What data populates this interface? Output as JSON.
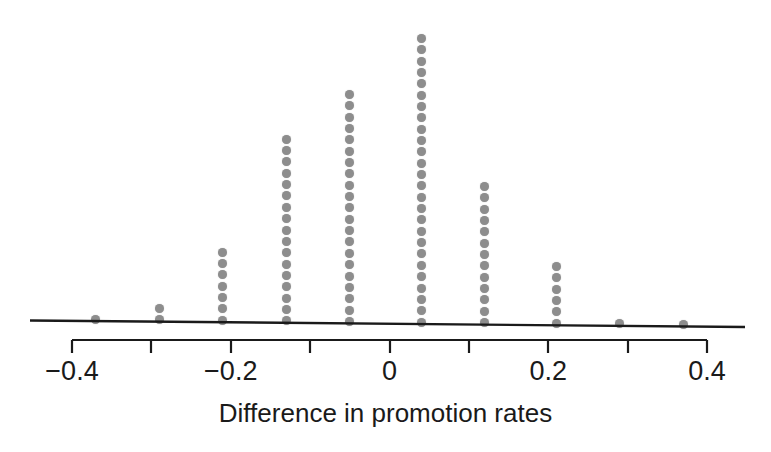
{
  "chart_data": {
    "type": "scatter",
    "plot_style": "dotplot",
    "title": "",
    "subtitle": "",
    "xlabel": "Difference in promotion rates",
    "ylabel": "",
    "xlim": [
      -0.44,
      0.44
    ],
    "xticks": [
      -0.4,
      -0.3,
      -0.2,
      -0.1,
      0,
      0.1,
      0.2,
      0.3,
      0.4
    ],
    "xticklabels": [
      "−0.4",
      "",
      "−0.2",
      "",
      "0",
      "",
      "0.2",
      "",
      "0.4"
    ],
    "labeled_ticks": [
      "−0.4",
      "−0.2",
      "0",
      "0.2",
      "0.4"
    ],
    "grid": false,
    "legend": false,
    "dot_color": "#8d8d8d",
    "axis_color": "#1a1a1a",
    "categories": [
      -0.37,
      -0.29,
      -0.21,
      -0.13,
      -0.05,
      0.04,
      0.12,
      0.21,
      0.29,
      0.37
    ],
    "values": [
      1,
      2,
      7,
      17,
      21,
      26,
      13,
      6,
      1,
      1
    ],
    "points": [
      {
        "x": -0.37,
        "count": 1
      },
      {
        "x": -0.29,
        "count": 2
      },
      {
        "x": -0.21,
        "count": 7
      },
      {
        "x": -0.13,
        "count": 17
      },
      {
        "x": -0.05,
        "count": 21
      },
      {
        "x": 0.04,
        "count": 26
      },
      {
        "x": 0.12,
        "count": 13
      },
      {
        "x": 0.21,
        "count": 6
      },
      {
        "x": 0.29,
        "count": 1
      },
      {
        "x": 0.37,
        "count": 1
      }
    ],
    "total_dots": 95,
    "annotations": []
  },
  "figure": {
    "axis_title": "Difference in promotion rates",
    "tick_labels": [
      {
        "value": -0.4,
        "text": "−0.4"
      },
      {
        "value": -0.2,
        "text": "−0.2"
      },
      {
        "value": 0,
        "text": "0"
      },
      {
        "value": 0.2,
        "text": "0.2"
      },
      {
        "value": 0.4,
        "text": "0.4"
      }
    ]
  }
}
